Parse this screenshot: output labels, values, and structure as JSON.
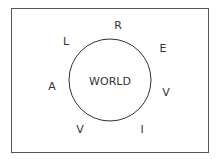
{
  "diagram": {
    "center_label": "WORLD",
    "circle": {
      "cx": 110,
      "cy": 80,
      "r": 41,
      "stroke": "#333333"
    },
    "frame": {
      "border_color": "#555555"
    },
    "letters": [
      {
        "char": "R",
        "x": 118,
        "y": 25
      },
      {
        "char": "L",
        "x": 66,
        "y": 41
      },
      {
        "char": "E",
        "x": 163,
        "y": 48
      },
      {
        "char": "A",
        "x": 52,
        "y": 86
      },
      {
        "char": "V",
        "x": 166,
        "y": 92
      },
      {
        "char": "V",
        "x": 80,
        "y": 129
      },
      {
        "char": "I",
        "x": 142,
        "y": 129
      }
    ]
  }
}
